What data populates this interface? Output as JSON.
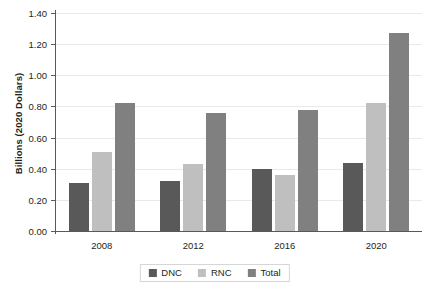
{
  "chart_data": {
    "type": "bar",
    "title": "",
    "xlabel": "",
    "ylabel": "Billions (2020 Dollars)",
    "categories": [
      "2008",
      "2012",
      "2016",
      "2020"
    ],
    "series": [
      {
        "name": "DNC",
        "color": "#595959",
        "values": [
          0.31,
          0.32,
          0.4,
          0.44
        ]
      },
      {
        "name": "RNC",
        "color": "#bfbfbf",
        "values": [
          0.51,
          0.43,
          0.36,
          0.82
        ]
      },
      {
        "name": "Total",
        "color": "#808080",
        "values": [
          0.82,
          0.76,
          0.78,
          1.27
        ]
      }
    ],
    "ylim": [
      0.0,
      1.4
    ],
    "ytick_values": [
      0.0,
      0.2,
      0.4,
      0.6,
      0.8,
      1.0,
      1.2,
      1.4
    ],
    "ytick_labels": [
      "0.00",
      "0.20",
      "0.40",
      "0.60",
      "0.80",
      "1.00",
      "1.20",
      "1.40"
    ],
    "grid": "horizontal",
    "legend_position": "bottom",
    "legend_entries": [
      "DNC",
      "RNC",
      "Total"
    ]
  },
  "axes": {
    "axis_color": "#58595b",
    "gridline_color": "#e9e9ea",
    "background": "#ffffff"
  }
}
